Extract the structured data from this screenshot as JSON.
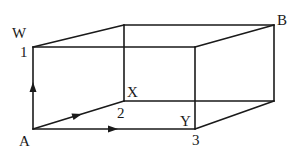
{
  "diagram": {
    "type": "rectangular-box-path",
    "vertices": {
      "front_top_left": [
        33,
        47
      ],
      "front_top_right": [
        195,
        47
      ],
      "front_bottom_left": [
        33,
        129
      ],
      "front_bottom_right": [
        195,
        129
      ],
      "back_top_left": [
        124,
        25
      ],
      "back_top_right": [
        274,
        25
      ],
      "back_bottom_left": [
        124,
        101
      ],
      "back_bottom_right": [
        274,
        101
      ]
    },
    "labels": {
      "A": "A",
      "W": "W",
      "X": "X",
      "Y": "Y",
      "B": "B",
      "one": "1",
      "two": "2",
      "three": "3"
    },
    "arrows": [
      {
        "name": "arrow-up",
        "from": "A",
        "to": "W"
      },
      {
        "name": "arrow-diagonal",
        "from": "A",
        "to": "X"
      },
      {
        "name": "arrow-right",
        "from": "A",
        "to": "Y"
      }
    ]
  }
}
